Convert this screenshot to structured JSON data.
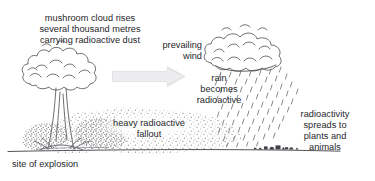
{
  "diagram": {
    "width": 375,
    "height": 181,
    "background_color": "#ffffff",
    "ink_color": "#3a3a3e",
    "arrow_color": "#e2e2e4",
    "stipple_color": "#8d8d91",
    "labels": {
      "mushroom_cloud": "mushroom cloud rises\nseveral thousand metres\ncarrying radioactive dust",
      "prevailing_wind": "prevailing\nwind",
      "rain_becomes_radioactive": "rain\nbecomes\nradioactive",
      "radioactivity_spreads": "radioactivity\nspreads to\nplants and\nanimals",
      "heavy_fallout": "heavy radioactive\nfallout",
      "site_of_explosion": "site of explosion"
    },
    "elements": {
      "mushroom_cloud_icon": "mushroom-cloud",
      "wind_arrow_icon": "right-arrow",
      "rain_cloud_icon": "rain-cloud",
      "rain_streaks_icon": "rain-streaks",
      "fallout_stipple_icon": "fallout-dust",
      "ground_line_icon": "ground-line",
      "plants_animals_icon": "plants-and-animals"
    }
  }
}
